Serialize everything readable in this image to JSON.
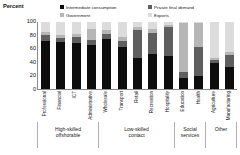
{
  "chart_data": {
    "type": "bar",
    "subtype": "stacked-bar-100",
    "title": "",
    "xlabel": "",
    "ylabel": "Percent",
    "ylim": [
      0,
      100
    ],
    "yticks": [
      "100",
      "80",
      "60",
      "40",
      "20",
      "0"
    ],
    "grid": false,
    "legend_position": "top",
    "categories": [
      "Professional",
      "Financial",
      "ICT",
      "Administrative",
      "Wholesale",
      "Transport",
      "Retail",
      "Recreation",
      "Hospitality",
      "Education",
      "Health",
      "Agriculture",
      "Manufacturing"
    ],
    "series": [
      {
        "name": "Intermediate consumption",
        "color": "#0d0d0d",
        "values": [
          72,
          70,
          69,
          66,
          74,
          62,
          47,
          52,
          49,
          17,
          20,
          39,
          33
        ]
      },
      {
        "name": "Private final demand",
        "color": "#5f5f5f",
        "values": [
          8,
          6,
          9,
          7,
          8,
          10,
          41,
          32,
          44,
          8,
          42,
          5,
          18
        ]
      },
      {
        "name": "Government",
        "color": "#b6b6b6",
        "values": [
          5,
          4,
          4,
          16,
          6,
          5,
          4,
          6,
          2,
          73,
          36,
          3,
          4
        ]
      },
      {
        "name": "Exports",
        "color": "#dcdcdc",
        "values": [
          15,
          20,
          18,
          11,
          12,
          23,
          8,
          10,
          5,
          2,
          2,
          53,
          45
        ]
      }
    ],
    "groups": [
      {
        "label": "High-skilled\noffshorable",
        "span": 4
      },
      {
        "label": "Low-skilled\ncontact",
        "span": 5
      },
      {
        "label": "Social\nservices",
        "span": 2
      },
      {
        "label": "Other",
        "span": 2
      }
    ]
  },
  "legend": {
    "items": [
      {
        "label": "Intermediate consumption",
        "color": "#0d0d0d",
        "marker": "square-marker"
      },
      {
        "label": "Private final demand",
        "color": "#5f5f5f",
        "marker": "square-marker"
      },
      {
        "label": "Government",
        "color": "#b6b6b6",
        "marker": "square-marker"
      },
      {
        "label": "Exports",
        "color": "#dcdcdc",
        "marker": "square-marker"
      }
    ]
  }
}
